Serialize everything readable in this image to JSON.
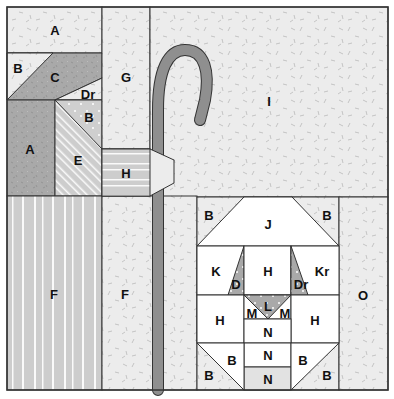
{
  "diagram": {
    "colors": {
      "background_fabric": "#ececec",
      "dark_fabric": "#a9a9a9",
      "mid_fabric": "#cfcfcf",
      "stripe_fabric": "#cdcdcd",
      "staff": "#8f8f8f",
      "sheep_white": "#ffffff",
      "outline": "#333333"
    },
    "labels": {
      "a_top": "A",
      "b_left": "B",
      "c": "C",
      "dr_top": "Dr",
      "b_mid": "B",
      "a_left": "A",
      "e": "E",
      "g": "G",
      "h_arm": "H",
      "i": "I",
      "f_left": "F",
      "f_mid": "F",
      "j": "J",
      "b_sheep_tl": "B",
      "b_sheep_tr": "B",
      "k": "K",
      "d": "D",
      "h_head": "H",
      "dr_sheep": "Dr",
      "kr": "Kr",
      "h_body_l": "H",
      "l": "L",
      "m_l": "M",
      "m_r": "M",
      "h_body_r": "H",
      "n_1": "N",
      "n_2": "N",
      "n_3": "N",
      "b_leg_l_top": "B",
      "b_leg_l_bot": "B",
      "b_leg_r_top": "B",
      "b_leg_r_bot": "B",
      "o": "O"
    }
  }
}
